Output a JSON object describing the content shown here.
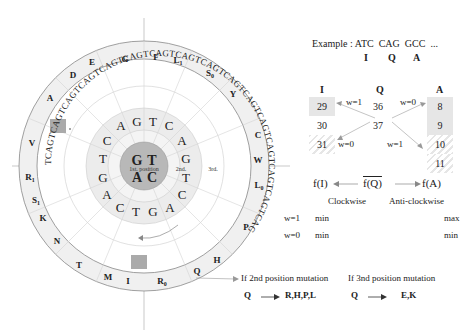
{
  "wheel": {
    "center_ring": {
      "top": [
        "G",
        "T"
      ],
      "bottom": [
        "A",
        "C"
      ],
      "label": "1st. position"
    },
    "second_ring_label": "2nd.",
    "third_ring_label": "3rd.",
    "second_position_letters": [
      "C",
      "A",
      "G",
      "T",
      "C",
      "A",
      "G",
      "T",
      "C",
      "A",
      "G",
      "T",
      "C",
      "A",
      "G",
      "T"
    ],
    "third_position_sequence": "TCAG repeated 16 times",
    "amino_acid_labels": [
      "G",
      "F",
      "L1",
      "S0",
      "Y",
      "C",
      "W",
      "L0",
      "P",
      "H",
      "Q",
      "R0",
      "I",
      "M",
      "T",
      "N",
      "K",
      "S1",
      "R1",
      "V",
      "A",
      "E",
      "D"
    ],
    "highlighted_codons": [
      "T (upper-left, 3rd ring)",
      "T (bottom, 3rd ring)"
    ]
  },
  "example": {
    "label": "Example :",
    "codons": [
      "ATC",
      "CAG",
      "GCC",
      "..."
    ],
    "aminos": [
      "I",
      "Q",
      "A"
    ]
  },
  "table": {
    "headers": [
      "I",
      "Q",
      "A"
    ],
    "I_values": [
      "29",
      "30",
      "31"
    ],
    "Q_values": [
      "36",
      "37"
    ],
    "A_values": [
      "8",
      "9",
      "10",
      "11"
    ],
    "weights": {
      "i_top": "w=1",
      "i_bottom": "w=0",
      "a_top": "w=0",
      "a_bottom": "w=1"
    }
  },
  "functions": {
    "left": "f(I)",
    "center": "f(Q)",
    "right": "f(A)",
    "left_dir": "Clockwise",
    "right_dir": "Anti-clockwise",
    "rows": [
      {
        "w": "w=1",
        "left": "min",
        "right": "max"
      },
      {
        "w": "w=0",
        "left": "min",
        "right": "min"
      }
    ]
  },
  "mutations": {
    "second": {
      "title": "If 2nd position mutation",
      "from": "Q",
      "to": "R,H,P,L"
    },
    "third": {
      "title": "If 3nd position mutation",
      "from": "Q",
      "to": "E,K"
    }
  }
}
